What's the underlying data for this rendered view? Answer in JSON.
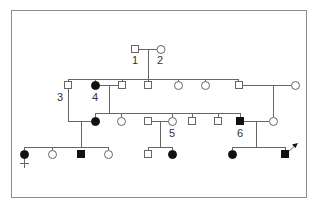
{
  "colors": {
    "frame": "#8c8c8c",
    "line": "#666666",
    "affected": "#111111",
    "unaffected_fill": "#ffffff",
    "label": "#333333"
  },
  "labels": {
    "i1": "1",
    "i2": "2",
    "i3": "3",
    "i4": "4",
    "i5": "5",
    "i6": "6"
  },
  "legend": {
    "square": "male",
    "circle": "female",
    "filled": "affected",
    "open": "unaffected",
    "cross": "deceased-mark",
    "arrow": "proband"
  },
  "generations": [
    {
      "gen": "I",
      "individuals": [
        {
          "id": "1",
          "sex": "male",
          "affected": false
        },
        {
          "id": "2",
          "sex": "female",
          "affected": false
        }
      ]
    },
    {
      "gen": "II",
      "individuals": [
        {
          "id": "3",
          "sex": "male",
          "affected": false
        },
        {
          "id": "4",
          "sex": "female",
          "affected": true
        },
        {
          "sex": "male",
          "affected": false,
          "spouse_of": "4"
        },
        {
          "sex": "male",
          "affected": false
        },
        {
          "sex": "female",
          "affected": false
        },
        {
          "sex": "female",
          "affected": false
        },
        {
          "sex": "male",
          "affected": false
        },
        {
          "sex": "female",
          "affected": false,
          "spouse": true
        }
      ]
    },
    {
      "gen": "III",
      "individuals": [
        {
          "sex": "female",
          "affected": true,
          "spouse_of": "3"
        },
        {
          "sex": "female",
          "affected": false
        },
        {
          "sex": "male",
          "affected": false
        },
        {
          "id": "5",
          "sex": "female",
          "affected": false
        },
        {
          "sex": "male",
          "affected": false
        },
        {
          "sex": "male",
          "affected": false
        },
        {
          "id": "6",
          "sex": "male",
          "affected": true
        },
        {
          "sex": "female",
          "affected": false,
          "spouse_of": "6"
        }
      ]
    },
    {
      "gen": "IV",
      "individuals": [
        {
          "sex": "female",
          "affected": true,
          "mark": "cross"
        },
        {
          "sex": "female",
          "affected": false
        },
        {
          "sex": "male",
          "affected": true
        },
        {
          "sex": "female",
          "affected": false
        },
        {
          "sex": "male",
          "affected": false
        },
        {
          "sex": "female",
          "affected": true
        },
        {
          "sex": "female",
          "affected": true
        },
        {
          "sex": "male",
          "affected": true,
          "proband": true
        }
      ]
    }
  ]
}
